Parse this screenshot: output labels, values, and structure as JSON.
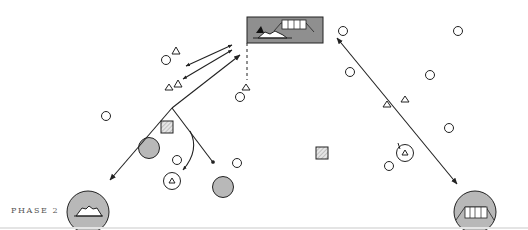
{
  "caption": {
    "phase_label": "PHASE 2"
  },
  "colors": {
    "stroke": "#222222",
    "shaded_fill": "#b8b8b8",
    "box_fill": "#8f8f8f",
    "background": "#ffffff"
  },
  "diagram": {
    "top_box": {
      "x": 247,
      "y": 17,
      "w": 76,
      "h": 26
    },
    "end_circles": [
      {
        "id": "left-goal",
        "cx": 88,
        "cy": 212,
        "r": 21,
        "glyph": "mound"
      },
      {
        "id": "right-goal",
        "cx": 475,
        "cy": 212,
        "r": 21,
        "glyph": "bar"
      }
    ],
    "open_circles": [
      [
        166,
        60
      ],
      [
        106,
        116
      ],
      [
        240,
        97
      ],
      [
        462,
        30
      ],
      [
        357,
        72
      ],
      [
        430,
        75
      ],
      [
        177,
        160
      ],
      [
        237,
        163
      ],
      [
        449,
        128
      ],
      [
        389,
        166
      ],
      [
        340,
        31
      ]
    ],
    "shaded_circles": [
      [
        149,
        148,
        10
      ],
      [
        223,
        187,
        10
      ]
    ],
    "ringed_triangles": [
      [
        172,
        180,
        9
      ],
      [
        404,
        153,
        9
      ]
    ],
    "triangles": [
      [
        176,
        50
      ],
      [
        169,
        88
      ],
      [
        178,
        82
      ],
      [
        246,
        88
      ],
      [
        387,
        105
      ],
      [
        406,
        99
      ]
    ],
    "hatched_squares": [
      [
        167,
        127
      ],
      [
        322,
        152
      ]
    ],
    "arrows": [
      {
        "x1": 189,
        "y1": 64,
        "x2": 233,
        "y2": 46,
        "double": true
      },
      {
        "x1": 183,
        "y1": 80,
        "x2": 233,
        "y2": 50,
        "double": true
      },
      {
        "x1": 172,
        "y1": 108,
        "x2": 239,
        "y2": 56,
        "double": false
      },
      {
        "x1": 172,
        "y1": 108,
        "x2": 112,
        "y2": 178,
        "double": false
      },
      {
        "x1": 337,
        "y1": 38,
        "x2": 457,
        "y2": 183,
        "double": true
      },
      {
        "x1": 172,
        "y1": 108,
        "x2": 213,
        "y2": 162,
        "double": false,
        "dot_end": true
      }
    ]
  }
}
